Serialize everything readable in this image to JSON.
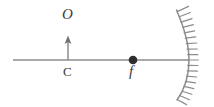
{
  "diagram": {
    "type": "ray-optics-concave-mirror",
    "width": 214,
    "height": 107,
    "background_color": "#ffffff",
    "stroke_color": "#8c8c8c",
    "label_color": "#3a3a3a",
    "labels": {
      "object": "O",
      "center_of_curvature": "C",
      "focal_point": "f"
    },
    "elements": {
      "principal_axis": {
        "name": "principal-axis",
        "x_start": 13,
        "x_end": 189,
        "y": 60
      },
      "object_arrow": {
        "name": "object-arrow",
        "x": 68,
        "y_base": 60,
        "y_tip": 36,
        "head_width": 7,
        "head_length": 8
      },
      "focal_point_dot": {
        "name": "focal-point-dot",
        "cx": 133,
        "cy": 60,
        "r": 4.2,
        "fill": "#2e2e2e"
      },
      "mirror": {
        "name": "concave-mirror-arc",
        "vertex_x": 189,
        "vertex_y": 60,
        "top_x": 176,
        "top_y": 10,
        "bottom_x": 177,
        "bottom_y": 100,
        "hatch_count": 18,
        "hatch_length": 11,
        "hatch_side": "convex-right"
      }
    }
  }
}
